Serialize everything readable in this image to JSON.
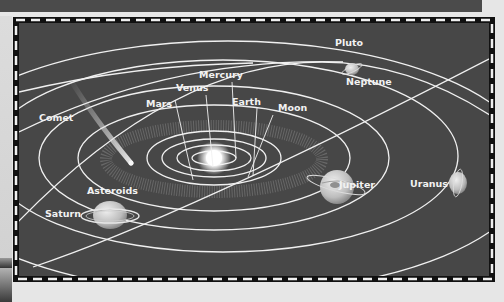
{
  "diagram": {
    "background_color": "#464646",
    "border_style": "dashed black and white",
    "labels": {
      "pluto": "Pluto",
      "neptune": "Neptune",
      "mercury": "Mercury",
      "venus": "Venus",
      "earth": "Earth",
      "moon": "Moon",
      "mars": "Mars",
      "comet": "Comet",
      "asteroids": "Asteroids",
      "jupiter": "Jupiter",
      "uranus": "Uranus",
      "saturn": "Saturn"
    },
    "center_body": "Sun",
    "bodies": [
      "Sun",
      "Mercury",
      "Venus",
      "Earth",
      "Moon",
      "Mars",
      "Asteroids",
      "Jupiter",
      "Saturn",
      "Uranus",
      "Neptune",
      "Pluto",
      "Comet"
    ]
  }
}
